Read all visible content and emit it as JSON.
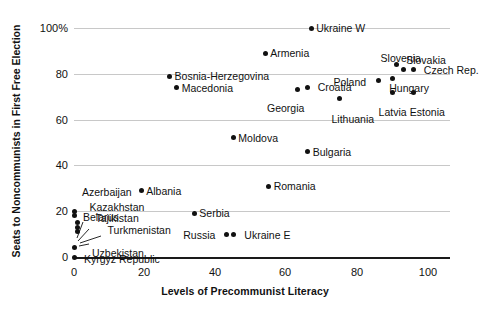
{
  "chart_data": {
    "type": "scatter",
    "title": "",
    "xlabel": "Levels of Precommunist Literacy",
    "ylabel": "Seats to Noncommunists in First Free Election",
    "xlim": [
      0,
      100
    ],
    "ylim": [
      0,
      100
    ],
    "xticks": [
      "0",
      "20",
      "40",
      "60",
      "80",
      "100"
    ],
    "yticks": [
      "0",
      "20",
      "40",
      "60",
      "80",
      "100%"
    ],
    "grid": "horizontal",
    "legend": "none",
    "marker_color": "#111111",
    "gridline_color": "#c8c8c8",
    "points": [
      {
        "label": "Ukraine W",
        "x": 67,
        "y": 100,
        "label_pos": "right"
      },
      {
        "label": "Armenia",
        "x": 54,
        "y": 89,
        "label_pos": "right"
      },
      {
        "label": "Slovenia",
        "x": 90,
        "y": 78,
        "label_pos": "above"
      },
      {
        "label": "Poland",
        "x": 86,
        "y": 77,
        "label_pos": "left"
      },
      {
        "label": "Slovakia",
        "x": 91,
        "y": 84,
        "label_pos": "right"
      },
      {
        "label": "Czech Rep.",
        "x": 96,
        "y": 82,
        "label_pos": "right"
      },
      {
        "label": "Hungary",
        "x": 93,
        "y": 82,
        "label_pos": "below"
      },
      {
        "label": "Bosnia-Herzegovina",
        "x": 27,
        "y": 79,
        "label_pos": "right"
      },
      {
        "label": "Macedonia",
        "x": 29,
        "y": 74,
        "label_pos": "right"
      },
      {
        "label": "Croatia",
        "x": 66,
        "y": 74,
        "label_pos": "right"
      },
      {
        "label": "Georgia",
        "x": 63,
        "y": 73,
        "label_pos": "below"
      },
      {
        "label": "Lithuania",
        "x": 75,
        "y": 69,
        "label_pos": "below"
      },
      {
        "label": "Latvia",
        "x": 90,
        "y": 72,
        "label_pos": "below"
      },
      {
        "label": "Estonia",
        "x": 96,
        "y": 72,
        "label_pos": "below"
      },
      {
        "label": "Moldova",
        "x": 45,
        "y": 52,
        "label_pos": "right"
      },
      {
        "label": "Bulgaria",
        "x": 66,
        "y": 46,
        "label_pos": "right"
      },
      {
        "label": "Romania",
        "x": 55,
        "y": 31,
        "label_pos": "right"
      },
      {
        "label": "Albania",
        "x": 19,
        "y": 29,
        "label_pos": "right"
      },
      {
        "label": "Serbia",
        "x": 34,
        "y": 19,
        "label_pos": "right"
      },
      {
        "label": "Azerbaijan",
        "x": 0,
        "y": 20,
        "label_pos": "above-right"
      },
      {
        "label": "Belarus",
        "x": 0,
        "y": 18,
        "label_pos": "right"
      },
      {
        "label": "Russia",
        "x": 43,
        "y": 10,
        "label_pos": "left"
      },
      {
        "label": "Ukraine E",
        "x": 45,
        "y": 10,
        "label_pos": "right"
      },
      {
        "label": "Kazakhstan",
        "x": 1,
        "y": 15,
        "label_pos": "leader"
      },
      {
        "label": "Tajikistan",
        "x": 1,
        "y": 13,
        "label_pos": "leader"
      },
      {
        "label": "Turkmenistan",
        "x": 1,
        "y": 11,
        "label_pos": "leader"
      },
      {
        "label": "Uzbekistan",
        "x": 0,
        "y": 4,
        "label_pos": "leader"
      },
      {
        "label": "Kyrgyz Republic",
        "x": 0,
        "y": 0,
        "label_pos": "right"
      }
    ]
  }
}
